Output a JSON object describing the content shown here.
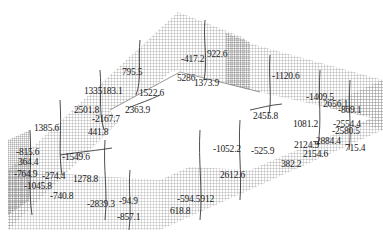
{
  "figure": {
    "type": "isometric 3D wireframe mesh of rectangular retaining wall structure with contour annotations",
    "colors": {
      "mesh": "#8a8a8a",
      "mesh_dense": "#6a6a6a",
      "contour": "#3a3a3a",
      "text": "#222222",
      "background": "#ffffff"
    }
  },
  "labels": [
    {
      "text": "795.5",
      "x": 122,
      "y": 68
    },
    {
      "text": "-417.2",
      "x": 181,
      "y": 55
    },
    {
      "text": "922.6",
      "x": 207,
      "y": 50
    },
    {
      "text": "5286",
      "x": 177,
      "y": 74
    },
    {
      "text": "1373.9",
      "x": 194,
      "y": 79
    },
    {
      "text": "1335183.1",
      "x": 84,
      "y": 87
    },
    {
      "text": "1522.6",
      "x": 139,
      "y": 89
    },
    {
      "text": "2363.9",
      "x": 125,
      "y": 106
    },
    {
      "text": "2501.8",
      "x": 74,
      "y": 106
    },
    {
      "text": "-2167.7",
      "x": 92,
      "y": 115
    },
    {
      "text": "441.8",
      "x": 88,
      "y": 128
    },
    {
      "text": "1385.6",
      "x": 34,
      "y": 124
    },
    {
      "text": "-1120.6",
      "x": 272,
      "y": 72
    },
    {
      "text": "-1409.5",
      "x": 306,
      "y": 93
    },
    {
      "text": "2656.1",
      "x": 323,
      "y": 100
    },
    {
      "text": "-869.1",
      "x": 338,
      "y": 106
    },
    {
      "text": "2455.8",
      "x": 253,
      "y": 112
    },
    {
      "text": "1081.2",
      "x": 293,
      "y": 120
    },
    {
      "text": "-2554.4",
      "x": 333,
      "y": 120
    },
    {
      "text": "-2580.5",
      "x": 332,
      "y": 127
    },
    {
      "text": "2124.9",
      "x": 294,
      "y": 141
    },
    {
      "text": "-2884.4",
      "x": 313,
      "y": 137
    },
    {
      "text": "715.4",
      "x": 345,
      "y": 144
    },
    {
      "text": "2154.6",
      "x": 303,
      "y": 150
    },
    {
      "text": "382.2",
      "x": 281,
      "y": 160
    },
    {
      "text": "-815.6",
      "x": 16,
      "y": 148
    },
    {
      "text": "-1549.6",
      "x": 62,
      "y": 153
    },
    {
      "text": "-1052.2",
      "x": 213,
      "y": 145
    },
    {
      "text": "-525.9",
      "x": 251,
      "y": 147
    },
    {
      "text": "364.4",
      "x": 18,
      "y": 158
    },
    {
      "text": "-764.9",
      "x": 14,
      "y": 170
    },
    {
      "text": "-274.4",
      "x": 42,
      "y": 172
    },
    {
      "text": "1278.8",
      "x": 73,
      "y": 175
    },
    {
      "text": "-1045.8",
      "x": 24,
      "y": 182
    },
    {
      "text": "-740.8",
      "x": 50,
      "y": 192
    },
    {
      "text": "2612.6",
      "x": 220,
      "y": 171
    },
    {
      "text": "-2839.3",
      "x": 87,
      "y": 200
    },
    {
      "text": "-94.9",
      "x": 119,
      "y": 197
    },
    {
      "text": "-594.5912",
      "x": 177,
      "y": 195
    },
    {
      "text": "618.8",
      "x": 170,
      "y": 207
    },
    {
      "text": "-857.1",
      "x": 117,
      "y": 213
    }
  ]
}
